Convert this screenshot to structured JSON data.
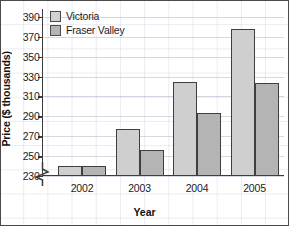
{
  "chart_data": {
    "type": "bar",
    "title": "",
    "xlabel": "Year",
    "ylabel": "Price ($ thousands)",
    "categories": [
      "2002",
      "2003",
      "2004",
      "2005"
    ],
    "series": [
      {
        "name": "Victoria",
        "color": "#cfcfcf",
        "values": [
          240,
          277,
          325,
          378
        ]
      },
      {
        "name": "Fraser Valley",
        "color": "#b4b4b4",
        "values": [
          240,
          256,
          293,
          324
        ]
      }
    ],
    "ylim": [
      230,
      398
    ],
    "yticks": [
      230,
      250,
      270,
      290,
      310,
      330,
      350,
      370,
      390
    ],
    "ytick_labels": [
      "230",
      "250",
      "270",
      "290",
      "310",
      "330",
      "350",
      "370",
      "390"
    ],
    "axis_break": true,
    "axis_break_note": "y-axis broken below 230",
    "grid": true,
    "legend_position": "top-left"
  },
  "legend": {
    "items": [
      {
        "label": "Victoria"
      },
      {
        "label": "Fraser Valley"
      }
    ]
  },
  "axes": {
    "x_title": "Year",
    "y_title": "Price ($ thousands)"
  }
}
